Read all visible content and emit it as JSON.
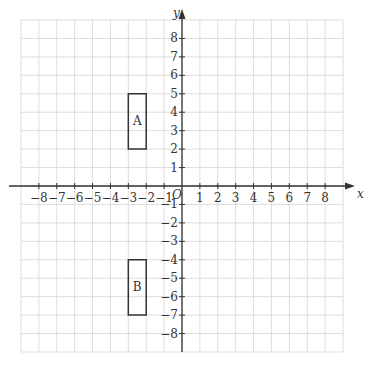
{
  "chart_data": {
    "type": "coordinate-grid",
    "xlabel": "x",
    "ylabel": "y",
    "origin_label": "O",
    "xlim": [
      -9,
      9
    ],
    "ylim": [
      -9,
      9
    ],
    "grid": true,
    "x_ticks": [
      -8,
      -7,
      -6,
      -5,
      -4,
      -3,
      -2,
      -1,
      1,
      2,
      3,
      4,
      5,
      6,
      7,
      8
    ],
    "y_ticks": [
      8,
      7,
      6,
      5,
      4,
      3,
      2,
      1,
      -1,
      -2,
      -3,
      -4,
      -5,
      -6,
      -7,
      -8
    ],
    "shapes": [
      {
        "label": "A",
        "type": "rectangle",
        "vertices": [
          [
            -3,
            2
          ],
          [
            -2,
            2
          ],
          [
            -2,
            5
          ],
          [
            -3,
            5
          ]
        ]
      },
      {
        "label": "B",
        "type": "rectangle",
        "vertices": [
          [
            -3,
            -7
          ],
          [
            -2,
            -7
          ],
          [
            -2,
            -4
          ],
          [
            -3,
            -4
          ]
        ]
      }
    ]
  },
  "colors": {
    "grid": "#dddddd",
    "axis": "#333333",
    "shape": "#333333"
  }
}
